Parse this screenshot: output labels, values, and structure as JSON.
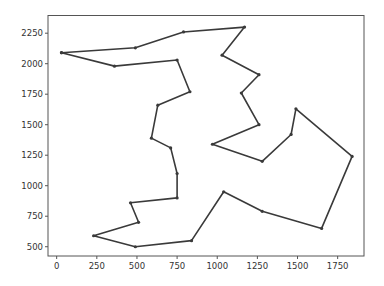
{
  "chart_data": {
    "type": "line",
    "title": "",
    "xlabel": "",
    "ylabel": "",
    "xlim": [
      -54,
      1914
    ],
    "ylim": [
      424,
      2395
    ],
    "grid": false,
    "legend": null,
    "x_ticks": [
      0,
      250,
      500,
      750,
      1000,
      1250,
      1500,
      1750
    ],
    "x_tick_labels": [
      "0",
      "250",
      "500",
      "750",
      "1000",
      "1250",
      "1500",
      "1750"
    ],
    "y_ticks": [
      500,
      750,
      1000,
      1250,
      1500,
      1750,
      2000,
      2250
    ],
    "y_tick_labels": [
      "500",
      "750",
      "1000",
      "1250",
      "1500",
      "1750",
      "2000",
      "2250"
    ],
    "line_color": "#3a3a3a",
    "marker": "dot",
    "closed_path": true,
    "series": [
      {
        "name": "tour",
        "x": [
          30,
          490,
          790,
          1170,
          1030,
          1260,
          1150,
          1260,
          970,
          1280,
          1460,
          1490,
          1840,
          1650,
          1280,
          1040,
          840,
          490,
          230,
          510,
          460,
          750,
          750,
          710,
          590,
          630,
          830,
          750,
          360,
          30
        ],
        "y": [
          2090,
          2130,
          2260,
          2300,
          2070,
          1910,
          1760,
          1500,
          1340,
          1200,
          1420,
          1630,
          1240,
          650,
          790,
          950,
          550,
          500,
          590,
          700,
          860,
          900,
          1100,
          1310,
          1390,
          1660,
          1770,
          2030,
          1980,
          2090
        ]
      }
    ]
  }
}
